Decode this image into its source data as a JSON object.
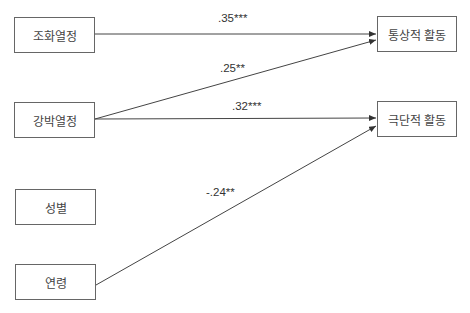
{
  "diagram": {
    "type": "path-model",
    "nodes": [
      {
        "id": "harmonious_passion",
        "label": "조화열정",
        "side": "left"
      },
      {
        "id": "obsessive_passion",
        "label": "강박열정",
        "side": "left"
      },
      {
        "id": "gender",
        "label": "성별",
        "side": "left"
      },
      {
        "id": "age",
        "label": "연령",
        "side": "left"
      },
      {
        "id": "normative_activity",
        "label": "통상적 활동",
        "side": "right"
      },
      {
        "id": "radical_activity",
        "label": "극단적 활동",
        "side": "right"
      }
    ],
    "edges": [
      {
        "from": "harmonious_passion",
        "to": "normative_activity",
        "label": ".35***"
      },
      {
        "from": "obsessive_passion",
        "to": "normative_activity",
        "label": ".25**"
      },
      {
        "from": "obsessive_passion",
        "to": "radical_activity",
        "label": ".32***"
      },
      {
        "from": "age",
        "to": "radical_activity",
        "label": "-.24**"
      }
    ]
  }
}
